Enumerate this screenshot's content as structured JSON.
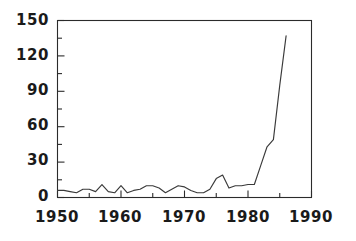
{
  "chart_data": {
    "type": "line",
    "title": "",
    "subtitle": "",
    "xlabel": "",
    "ylabel": "",
    "xlim": [
      1950,
      1990
    ],
    "ylim": [
      0,
      150
    ],
    "grid": false,
    "legend": "none",
    "x_tick_labels": [
      "1950",
      "1960",
      "1970",
      "1980",
      "1990"
    ],
    "x_tick_values": [
      1950,
      1960,
      1970,
      1980,
      1990
    ],
    "x_minor_tick_values": [
      1955,
      1965,
      1975,
      1985
    ],
    "y_tick_labels": [
      "0",
      "30",
      "60",
      "90",
      "120",
      "150"
    ],
    "y_tick_values": [
      0,
      30,
      60,
      90,
      120,
      150
    ],
    "y_minor_tick_values": [
      15,
      45,
      75,
      105,
      135
    ],
    "series": [
      {
        "name": "count",
        "x": [
          1950,
          1951,
          1952,
          1953,
          1954,
          1955,
          1956,
          1957,
          1958,
          1959,
          1960,
          1961,
          1962,
          1963,
          1964,
          1965,
          1966,
          1967,
          1968,
          1969,
          1970,
          1971,
          1972,
          1973,
          1974,
          1975,
          1976,
          1977,
          1978,
          1979,
          1980,
          1981,
          1982,
          1983,
          1984,
          1985,
          1986
        ],
        "values": [
          6,
          6,
          5,
          4,
          7,
          7,
          5,
          11,
          5,
          4,
          10,
          4,
          6,
          7,
          10,
          10,
          8,
          4,
          7,
          10,
          9,
          6,
          4,
          4,
          7,
          16,
          19,
          8,
          10,
          10,
          11,
          11,
          27,
          43,
          49,
          95,
          137
        ]
      }
    ]
  },
  "axes": {
    "x_axis_name": "year-axis",
    "y_axis_name": "value-axis"
  }
}
